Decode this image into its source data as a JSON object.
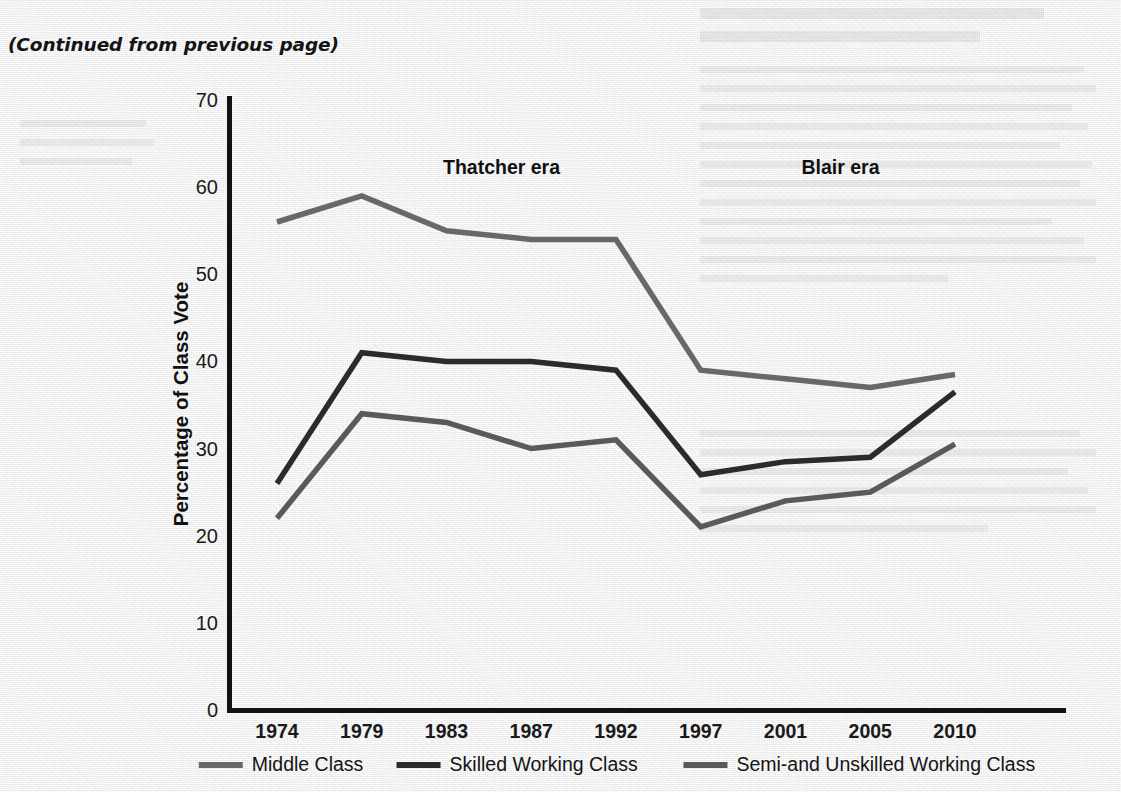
{
  "page": {
    "continued_note": "(Continued from previous page)"
  },
  "chart_data": {
    "type": "line",
    "title": "",
    "xlabel": "",
    "ylabel": "Percentage of Class Vote",
    "categories": [
      "1974",
      "1979",
      "1983",
      "1987",
      "1992",
      "1997",
      "2001",
      "2005",
      "2010"
    ],
    "ylim": [
      0,
      70
    ],
    "ytick_step": 10,
    "yticks": [
      "0",
      "10",
      "20",
      "30",
      "40",
      "50",
      "60",
      "70"
    ],
    "grid": false,
    "legend_position": "bottom",
    "series": [
      {
        "name": "Middle Class",
        "color": "#686868",
        "values": [
          56,
          59,
          55,
          54,
          54,
          39,
          38,
          37,
          38.5
        ]
      },
      {
        "name": "Skilled Working Class",
        "color": "#2b2b2b",
        "values": [
          26,
          41,
          40,
          40,
          39,
          27,
          28.5,
          29,
          36.5
        ]
      },
      {
        "name": "Semi-and Unskilled Working Class",
        "color": "#5a5a5a",
        "values": [
          22,
          34,
          33,
          30,
          31,
          21,
          24,
          25,
          30.5
        ]
      }
    ],
    "annotations": [
      {
        "text": "Thatcher era",
        "x_category": "1983",
        "y_value": 61.5
      },
      {
        "text": "Blair era",
        "x_category": "2001",
        "y_value": 61.5
      }
    ]
  },
  "legend": {
    "items": [
      {
        "label": "Middle Class",
        "color": "#686868"
      },
      {
        "label": "Skilled Working Class",
        "color": "#2b2b2b"
      },
      {
        "label": "Semi-and Unskilled Working Class",
        "color": "#5a5a5a"
      }
    ]
  },
  "axes": {
    "y_title": "Percentage of Class Vote"
  }
}
